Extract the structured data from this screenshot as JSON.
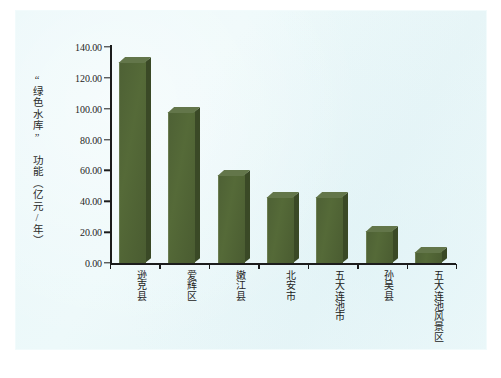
{
  "chart_data": {
    "type": "bar",
    "title": "",
    "subtitle": "",
    "xlabel": "",
    "ylabel": "“绿色水库” 功能（亿元/年）",
    "categories": [
      "逊克县",
      "爱辉区",
      "嫩江县",
      "北安市",
      "五大连池市",
      "孙吴县",
      "五大连池风景区"
    ],
    "values": [
      130.0,
      98.0,
      57.0,
      43.0,
      43.0,
      21.0,
      7.0
    ],
    "ylim": [
      0,
      140
    ],
    "ytick_values": [
      0,
      20,
      40,
      60,
      80,
      100,
      120,
      140
    ],
    "ytick_labels": [
      "0.00",
      "20.00",
      "40.00",
      "60.00",
      "80.00",
      "100.00",
      "120.00",
      "140.00"
    ],
    "grid": false,
    "legend": null,
    "legend_position": "none",
    "bar_color": "#4e6135",
    "bar_side_color": "#3a4926",
    "bar_top_color": "#63764a",
    "axis_color": "#1c1c1c",
    "background_color": "#eaf7f9",
    "annotations": []
  },
  "page": {
    "paper_color": "#ffffff",
    "scan_color": "#eaf7f9"
  }
}
